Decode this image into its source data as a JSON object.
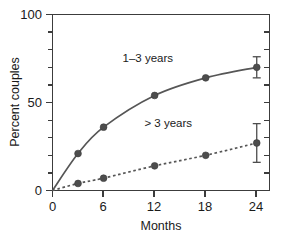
{
  "chart_data": {
    "type": "line",
    "title": "",
    "xlabel": "Months",
    "ylabel": "Percent couples",
    "xlim": [
      0,
      25.5
    ],
    "ylim": [
      0,
      100
    ],
    "xticks": [
      0,
      6,
      12,
      18,
      24
    ],
    "xtick_labels": [
      "0",
      "6",
      "12",
      "18",
      "24"
    ],
    "yticks": [
      0,
      50,
      100
    ],
    "ytick_labels": [
      "0",
      "50",
      "100"
    ],
    "yminor_ticks": [
      10,
      20,
      30,
      40,
      60,
      70,
      80,
      90
    ],
    "grid": false,
    "legend_position": "inline-annotations",
    "x": [
      0,
      3,
      6,
      12,
      18,
      24
    ],
    "series": [
      {
        "name": "1–3 years",
        "style": "solid",
        "values": [
          0,
          21,
          36,
          54,
          64,
          70
        ],
        "error_at_last": 6,
        "label_text": "1–3 years",
        "label_x": 11.2,
        "label_y": 73
      },
      {
        "name": "> 3 years",
        "style": "dashed",
        "values": [
          0,
          4,
          7,
          14,
          20,
          27
        ],
        "error_at_last": 11,
        "label_text": "> 3 years",
        "label_x": 13.6,
        "label_y": 36
      }
    ],
    "colors": {
      "axis": "#3c3c3c",
      "series_line": "#565656",
      "marker": "#4d4d4d",
      "text": "#1a1a1a",
      "background": "#ffffff"
    }
  },
  "axes": {
    "y_title": "Percent couples",
    "x_title": "Months",
    "y_labels": {
      "top": "100",
      "middle": "50",
      "bottom": "0"
    },
    "x_labels": {
      "t0": "0",
      "t1": "6",
      "t2": "12",
      "t3": "18",
      "t4": "24"
    }
  },
  "annotations": {
    "upper_series": "1–3 years",
    "lower_series": "> 3 years"
  }
}
